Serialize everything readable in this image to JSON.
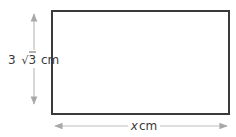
{
  "diagram": {
    "shape": "rectangle",
    "height_label": {
      "coefficient": "3",
      "radical": "√",
      "radicand": "3",
      "unit": "cm"
    },
    "width_label": {
      "variable": "x",
      "unit": "cm"
    },
    "colors": {
      "rectangle_stroke": "#3a3a3a",
      "arrow": "#b5b5b5",
      "text": "#3a3a3a"
    }
  }
}
